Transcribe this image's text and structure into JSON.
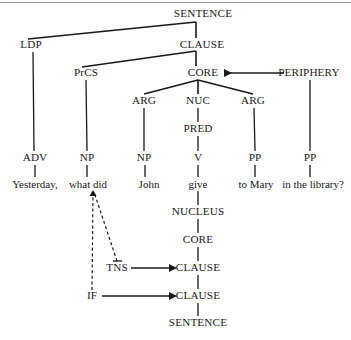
{
  "diagram": {
    "type": "role-and-reference-grammar-tree",
    "title_rule": "horizontal-divider",
    "sentence_text": "Yesterday, what did John give to Mary in the library?",
    "constituent_projection": {
      "root": "SENTENCE",
      "nodes": [
        {
          "id": "sentence_top",
          "label": "SENTENCE",
          "x": 203,
          "y": 14
        },
        {
          "id": "ldp",
          "label": "LDP",
          "x": 31,
          "y": 45
        },
        {
          "id": "clause_top",
          "label": "CLAUSE",
          "x": 202,
          "y": 45
        },
        {
          "id": "prcs",
          "label": "PrCS",
          "x": 86,
          "y": 73
        },
        {
          "id": "core_top",
          "label": "CORE",
          "x": 203,
          "y": 73
        },
        {
          "id": "periphery",
          "label": "PERIPHERY",
          "x": 309,
          "y": 73
        },
        {
          "id": "arg1",
          "label": "ARG",
          "x": 144,
          "y": 101
        },
        {
          "id": "nuc",
          "label": "NUC",
          "x": 198,
          "y": 101
        },
        {
          "id": "arg2",
          "label": "ARG",
          "x": 253,
          "y": 101
        },
        {
          "id": "pred",
          "label": "PRED",
          "x": 198,
          "y": 129
        },
        {
          "id": "adv",
          "label": "ADV",
          "x": 35,
          "y": 158
        },
        {
          "id": "np1",
          "label": "NP",
          "x": 87,
          "y": 158
        },
        {
          "id": "np2",
          "label": "NP",
          "x": 144,
          "y": 158
        },
        {
          "id": "v",
          "label": "V",
          "x": 198,
          "y": 158
        },
        {
          "id": "pp1",
          "label": "PP",
          "x": 255,
          "y": 158
        },
        {
          "id": "pp2",
          "label": "PP",
          "x": 310,
          "y": 158
        }
      ]
    },
    "words": [
      {
        "id": "w_yesterday",
        "text": "Yesterday,",
        "x": 35,
        "y": 184
      },
      {
        "id": "w_whatdid",
        "text": "what did",
        "x": 88,
        "y": 184
      },
      {
        "id": "w_john",
        "text": "John",
        "x": 149,
        "y": 184
      },
      {
        "id": "w_give",
        "text": "give",
        "x": 198,
        "y": 184
      },
      {
        "id": "w_tomary",
        "text": "to Mary",
        "x": 256,
        "y": 184
      },
      {
        "id": "w_inthelibrary",
        "text": "in the library?",
        "x": 313,
        "y": 184
      }
    ],
    "operator_projection": {
      "nodes": [
        {
          "id": "nucleus_op",
          "label": "NUCLEUS",
          "x": 198,
          "y": 212
        },
        {
          "id": "core_op",
          "label": "CORE",
          "x": 198,
          "y": 240
        },
        {
          "id": "clause_tns",
          "label": "CLAUSE",
          "x": 198,
          "y": 268
        },
        {
          "id": "clause_if",
          "label": "CLAUSE",
          "x": 198,
          "y": 296
        },
        {
          "id": "sentence_op",
          "label": "SENTENCE",
          "x": 198,
          "y": 323
        }
      ],
      "operators": [
        {
          "id": "tns",
          "label": "TNS",
          "x": 117,
          "y": 268,
          "scope": "CLAUSE"
        },
        {
          "id": "if",
          "label": "IF",
          "x": 92,
          "y": 296,
          "scope": "CLAUSE"
        }
      ]
    },
    "arrows": [
      {
        "id": "periphery-to-core",
        "from": "PERIPHERY",
        "to": "CORE",
        "style": "solid",
        "direction": "left"
      },
      {
        "id": "tns-to-clause",
        "from": "TNS",
        "to": "CLAUSE",
        "style": "solid",
        "direction": "right"
      },
      {
        "id": "if-to-clause",
        "from": "IF",
        "to": "CLAUSE",
        "style": "solid",
        "direction": "right"
      }
    ],
    "dashed_links": [
      {
        "id": "tns-to-whatdid",
        "from": "TNS",
        "to": "what did",
        "style": "dashed"
      },
      {
        "id": "if-to-whatdid",
        "from": "IF",
        "to": "what did",
        "style": "dashed"
      }
    ],
    "colors": {
      "ink": "#1a1a1a",
      "rule": "#9a9a9a",
      "background": "#ffffff"
    }
  }
}
